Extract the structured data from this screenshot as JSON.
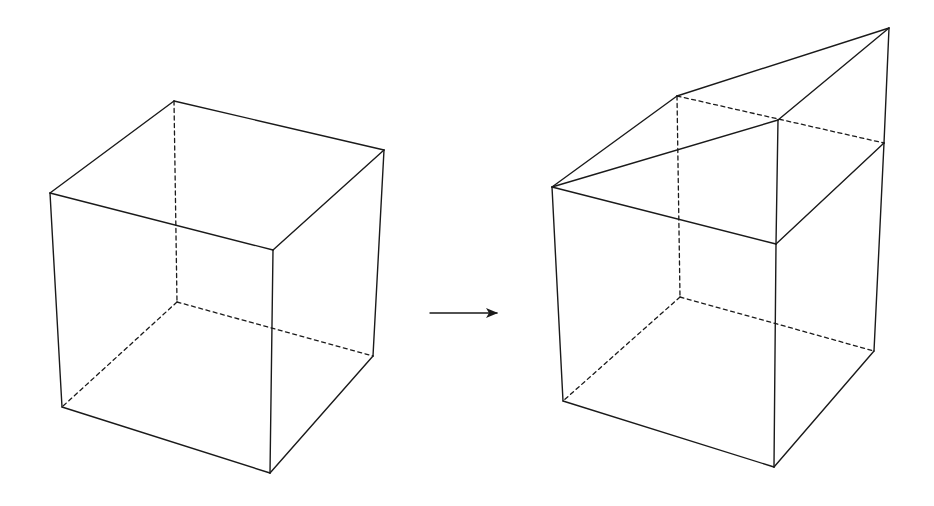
{
  "figure": {
    "left_cube": {
      "label": "original cube",
      "vertices": {
        "top_left": [
          50,
          193
        ],
        "top_back": [
          174,
          101
        ],
        "top_right": [
          384,
          150
        ],
        "top_front": [
          273,
          250
        ],
        "bot_left": [
          62,
          407
        ],
        "bot_back": [
          177,
          302
        ],
        "bot_right": [
          373,
          356
        ],
        "bot_front": [
          270,
          473
        ]
      }
    },
    "arrow": {
      "from": [
        430,
        313
      ],
      "to": [
        498,
        313
      ],
      "meaning": "transforms into"
    },
    "right_cube": {
      "label": "cube with wedge on top",
      "vertices": {
        "top_left": [
          552,
          187
        ],
        "top_back": [
          680,
          128
        ],
        "top_right": [
          884,
          143
        ],
        "top_front": [
          776,
          244
        ],
        "wedge_back": [
          677,
          96
        ],
        "wedge_front": [
          778,
          120
        ],
        "wedge_peak": [
          889,
          28
        ],
        "bot_left": [
          563,
          401
        ],
        "bot_back": [
          680,
          297
        ],
        "bot_right": [
          874,
          351
        ],
        "bot_front": [
          774,
          467
        ]
      }
    },
    "colors": {
      "line": "#1a1a1a",
      "background": "#ffffff"
    }
  }
}
